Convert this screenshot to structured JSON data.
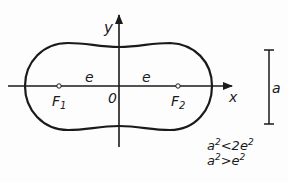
{
  "diagram": {
    "type": "cassini-oval",
    "axes": {
      "x_label": "x",
      "y_label": "y",
      "origin_label": "0"
    },
    "foci": [
      {
        "label": "F",
        "subscript": "1"
      },
      {
        "label": "F",
        "subscript": "2"
      }
    ],
    "distance_labels": [
      "e",
      "e"
    ],
    "scale_bar_label": "a",
    "conditions": [
      {
        "lhs_base": "a",
        "lhs_exp": "2",
        "op": "<",
        "rhs_coef": "2",
        "rhs_base": "e",
        "rhs_exp": "2"
      },
      {
        "lhs_base": "a",
        "lhs_exp": "2",
        "op": ">",
        "rhs_coef": "",
        "rhs_base": "e",
        "rhs_exp": "2"
      }
    ],
    "colors": {
      "stroke": "#1a1a1a",
      "background": "#fdfdfd"
    }
  }
}
